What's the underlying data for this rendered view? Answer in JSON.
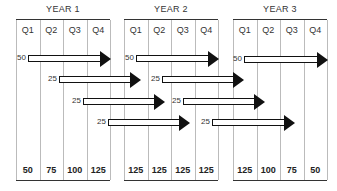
{
  "diagram": {
    "type": "staggered-rollout-timeline",
    "years": [
      {
        "label": "YEAR 1",
        "quarters": [
          "Q1",
          "Q2",
          "Q3",
          "Q4"
        ],
        "totals": [
          "50",
          "75",
          "100",
          "125"
        ]
      },
      {
        "label": "YEAR 2",
        "quarters": [
          "Q1",
          "Q2",
          "Q3",
          "Q4"
        ],
        "totals": [
          "125",
          "125",
          "125",
          "125"
        ]
      },
      {
        "label": "YEAR 3",
        "quarters": [
          "Q1",
          "Q2",
          "Q3",
          "Q4"
        ],
        "totals": [
          "125",
          "100",
          "75",
          "50"
        ]
      }
    ],
    "arrows": [
      {
        "value": "50",
        "row": 1,
        "start_year": 1,
        "start_quarter": 1
      },
      {
        "value": "25",
        "row": 2,
        "start_year": 1,
        "start_quarter": 2
      },
      {
        "value": "25",
        "row": 3,
        "start_year": 1,
        "start_quarter": 3
      },
      {
        "value": "25",
        "row": 4,
        "start_year": 1,
        "start_quarter": 4
      },
      {
        "value": "50",
        "row": 1,
        "start_year": 2,
        "start_quarter": 1
      },
      {
        "value": "25",
        "row": 2,
        "start_year": 2,
        "start_quarter": 2
      },
      {
        "value": "25",
        "row": 3,
        "start_year": 2,
        "start_quarter": 3
      },
      {
        "value": "25",
        "row": 4,
        "start_year": 2,
        "start_quarter": 4
      },
      {
        "value": "50",
        "row": 1,
        "start_year": 3,
        "start_quarter": 1
      }
    ]
  }
}
